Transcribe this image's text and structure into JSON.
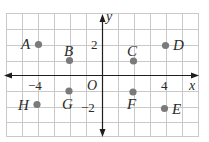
{
  "figure": {
    "axes": {
      "x_label": "x",
      "y_label": "y",
      "origin_label": "O",
      "x_ticks": [
        {
          "value": -4,
          "label": "−4"
        },
        {
          "value": 4,
          "label": "4"
        }
      ],
      "y_ticks": [
        {
          "value": 2,
          "label": "2"
        },
        {
          "value": -2,
          "label": "−2"
        }
      ]
    },
    "grid": {
      "x_min": -6,
      "x_max": 6,
      "y_min": -4,
      "y_max": 4,
      "step": 1
    },
    "points": [
      {
        "name": "A",
        "x": -4,
        "y": 2
      },
      {
        "name": "B",
        "x": -2,
        "y": 1
      },
      {
        "name": "C",
        "x": 2,
        "y": 1
      },
      {
        "name": "D",
        "x": 4,
        "y": 2
      },
      {
        "name": "E",
        "x": 4,
        "y": -2
      },
      {
        "name": "F",
        "x": 2,
        "y": -1
      },
      {
        "name": "G",
        "x": -2,
        "y": -1
      },
      {
        "name": "H",
        "x": -4,
        "y": -2
      }
    ],
    "colors": {
      "grid": "#c9c9c9",
      "axis": "#1e1e1e",
      "point": "#7a7a7a",
      "text": "#2a2a2a"
    }
  }
}
